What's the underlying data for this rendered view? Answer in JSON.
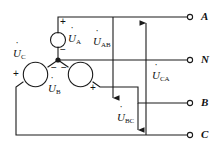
{
  "diagram": {
    "stroke_color": "#1a1a1a",
    "background_color": "#ffffff",
    "terminals": [
      {
        "id": "A",
        "label": "A",
        "x": 196,
        "y": 17
      },
      {
        "id": "N",
        "label": "N",
        "x": 196,
        "y": 60
      },
      {
        "id": "B",
        "label": "B",
        "x": 196,
        "y": 103
      },
      {
        "id": "C",
        "label": "C",
        "x": 196,
        "y": 135
      }
    ],
    "sources": [
      {
        "id": "UA",
        "name": "U",
        "subscript": "A",
        "plus": "+",
        "minus": "−"
      },
      {
        "id": "UB",
        "name": "U",
        "subscript": "B",
        "plus": "+",
        "minus": "−"
      },
      {
        "id": "UC",
        "name": "U",
        "subscript": "C",
        "plus": "+",
        "minus": "−"
      }
    ],
    "voltage_arrows": [
      {
        "id": "UAB",
        "name": "U",
        "subscript": "AB",
        "direction": "down"
      },
      {
        "id": "UBC",
        "name": "U",
        "subscript": "BC",
        "direction": "down"
      },
      {
        "id": "UCA",
        "name": "U",
        "subscript": "CA",
        "direction": "up"
      }
    ],
    "labels": {
      "u": "U",
      "sub_a": "A",
      "sub_b": "B",
      "sub_c": "C",
      "sub_ab": "AB",
      "sub_bc": "BC",
      "sub_ca": "CA",
      "plus": "+",
      "minus": "−",
      "term_a": "A",
      "term_n": "N",
      "term_b": "B",
      "term_c": "C"
    }
  }
}
